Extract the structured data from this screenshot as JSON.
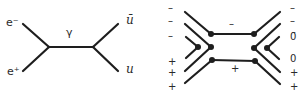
{
  "diagram_left": {
    "title": "Feynman diagram: e+ e- annihilation to u u-bar via photon",
    "labels": {
      "electron": "e⁻",
      "positron": "e⁺",
      "photon": "γ",
      "antiquark": "ū",
      "quark": "u"
    }
  },
  "diagram_right": {
    "title": "Quark/charge flow diagram",
    "left_labels": [
      "–",
      "–",
      "–",
      "+",
      "+",
      "+"
    ],
    "right_labels": [
      "–",
      "–",
      "0̄",
      "0",
      "+",
      "+"
    ],
    "middle_top": "–",
    "middle_bottom": "+"
  },
  "colors": {
    "line": "#1e1e1e",
    "text": "#2a2a2a"
  }
}
